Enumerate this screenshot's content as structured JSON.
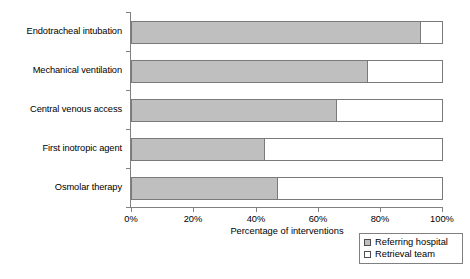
{
  "chart_data": {
    "type": "bar",
    "orientation": "horizontal",
    "stacked": true,
    "title": "",
    "xlabel": "Percentage of interventions",
    "ylabel": "",
    "xlim": [
      0,
      100
    ],
    "xticks": [
      "0%",
      "20%",
      "40%",
      "60%",
      "80%",
      "100%"
    ],
    "xtick_values": [
      0,
      20,
      40,
      60,
      80,
      100
    ],
    "grid": false,
    "legend_position": "bottom-right",
    "categories": [
      "Endotracheal intubation",
      "Mechanical ventilation",
      "Central venous access",
      "First inotropic agent",
      "Osmolar therapy"
    ],
    "series": [
      {
        "name": "Referring hospital",
        "color": "#bfbfbf",
        "values": [
          93,
          76,
          66,
          43,
          47
        ]
      },
      {
        "name": "Retrieval team",
        "color": "#ffffff",
        "values": [
          7,
          24,
          34,
          57,
          53
        ]
      }
    ]
  },
  "axis": {
    "x_title": "Percentage of interventions",
    "tick_labels": [
      "0%",
      "20%",
      "40%",
      "60%",
      "80%",
      "100%"
    ]
  },
  "categories": [
    {
      "label": "Endotracheal intubation"
    },
    {
      "label": "Mechanical ventilation"
    },
    {
      "label": "Central venous access"
    },
    {
      "label": "First inotropic agent"
    },
    {
      "label": "Osmolar therapy"
    }
  ],
  "legend": {
    "items": [
      {
        "label": "Referring hospital",
        "swatch": "gray-square-icon"
      },
      {
        "label": "Retrieval team",
        "swatch": "white-square-icon"
      }
    ]
  }
}
